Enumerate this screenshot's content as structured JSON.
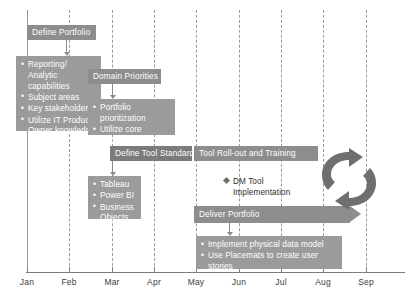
{
  "diagram": {
    "colors": {
      "bar": "#8d8d8d",
      "bar_dark": "#7b7b7b",
      "detail_box": "#9b9b9b",
      "gridline": "#9a9a9a",
      "axis": "#7d7d7d",
      "bar_text": "#ffffff",
      "label_text": "#3c3c3c"
    },
    "timeline": {
      "months": [
        "Jan",
        "Feb",
        "Mar",
        "Apr",
        "May",
        "Jun",
        "Jul",
        "Aug",
        "Sep"
      ]
    },
    "workstreams": [
      {
        "id": "define-portfolio",
        "bar_label": "Define Portfolio",
        "bullets": [
          "Reporting/ Analytic capabilities",
          "Subject areas",
          "Key stakeholders",
          "Utilize IT Product Owner knowledge"
        ]
      },
      {
        "id": "domain-priorities",
        "bar_label": "Domain Priorities",
        "bullets": [
          "Portfolio prioritization",
          "Utilize core working group"
        ]
      },
      {
        "id": "define-tool-standards",
        "bar_label": "Define Tool Standards",
        "bullets": [
          "Tableau",
          "Power BI",
          "Business Objects"
        ]
      },
      {
        "id": "tool-rollout-and-training",
        "bar_label": "Tool Roll-out and Training",
        "bullets": []
      },
      {
        "id": "deliver-portfolio",
        "bar_label": "Deliver Portfolio",
        "bullets": [
          "Implement physical data model",
          "Use Placemats to create user stories"
        ]
      }
    ],
    "milestones": [
      {
        "id": "dm-tool-implementation",
        "label": "DM Tool\nImplementation"
      }
    ],
    "icons": [
      {
        "id": "continuous-cycle",
        "name": "cycle-arrows-icon"
      }
    ]
  }
}
